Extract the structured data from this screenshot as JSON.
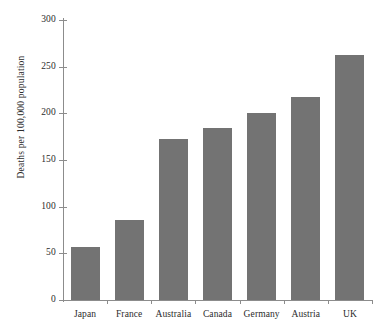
{
  "chart_data": {
    "type": "bar",
    "title": "",
    "subtitle": "",
    "xlabel": "",
    "ylabel": "Deaths per 100,000 population",
    "categories": [
      "Japan",
      "France",
      "Australia",
      "Canada",
      "Germany",
      "Austria",
      "UK"
    ],
    "values": [
      57,
      86,
      172,
      184,
      200,
      218,
      263
    ],
    "ylim": [
      0,
      300
    ],
    "yticks": [
      0,
      50,
      100,
      150,
      200,
      250,
      300
    ],
    "ytick_labels": [
      "0",
      "50",
      "100",
      "150",
      "200",
      "250",
      "300"
    ],
    "grid": false,
    "legend": null,
    "bar_color": "#737373",
    "axis_color": "#8c8c8c",
    "text_color": "#2b2b2b",
    "background_color": "#ffffff"
  }
}
